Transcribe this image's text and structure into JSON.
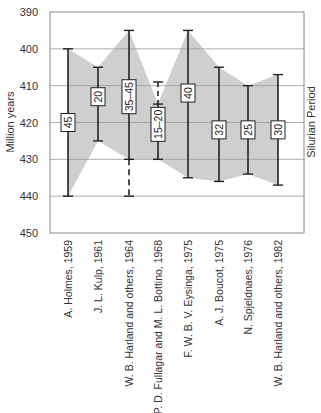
{
  "chart_data": {
    "type": "range-bar",
    "title": "",
    "ylabel": "Million years",
    "right_label": "Silurian Period",
    "xlabel": "",
    "ylim": [
      390,
      450
    ],
    "y_inverted": true,
    "yticks": [
      390,
      400,
      410,
      420,
      430,
      440,
      450
    ],
    "grid": true,
    "shaded_envelope": true,
    "categories": [
      "A. Holmes, 1959",
      "J. L. Kulp, 1961",
      "W. B. Harland and others, 1964",
      "P. D. Fullagar and M. L. Bottino, 1968",
      "F. W. B. V. Eysinga, 1975",
      "A. J. Boucot, 1975",
      "N. Spjeldnaes, 1976",
      "W. B. Harland and others, 1982"
    ],
    "series": [
      {
        "name": "Silurian start/end (Ma)",
        "values": [
          {
            "top": 400,
            "bottom": 440,
            "duration_label": "45"
          },
          {
            "top": 405,
            "bottom": 425,
            "duration_label": "20"
          },
          {
            "top": 395,
            "bottom": 430,
            "dashed_bottom": 440,
            "duration_label": "35–45"
          },
          {
            "top": 415,
            "bottom": 430,
            "dashed_top": 409,
            "duration_label": "15–20"
          },
          {
            "top": 395,
            "bottom": 435,
            "duration_label": "40"
          },
          {
            "top": 405,
            "bottom": 436,
            "duration_label": "32"
          },
          {
            "top": 410,
            "bottom": 434,
            "duration_label": "25"
          },
          {
            "top": 407,
            "bottom": 437,
            "duration_label": "30"
          }
        ]
      }
    ]
  }
}
